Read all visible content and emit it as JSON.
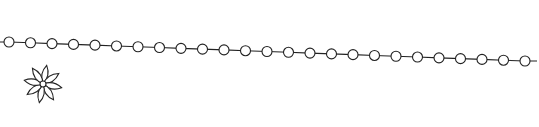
{
  "illustration": {
    "background": "#ffffff",
    "stroke": "#222222",
    "chain": {
      "start": [
        9,
        42
      ],
      "end": [
        525,
        61
      ],
      "bead_count": 25,
      "bead_radius": 5,
      "lead_in": [
        0,
        42
      ]
    },
    "flower": {
      "center": [
        43,
        84
      ],
      "petals": 8,
      "petal_length": 19,
      "petal_width": 6,
      "center_radius": 3
    }
  }
}
